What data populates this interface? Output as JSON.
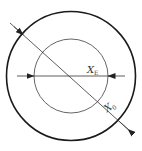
{
  "diagram": {
    "labels": {
      "inner_main": "X",
      "inner_sub": "E",
      "outer_main": "X",
      "outer_sub": "0"
    },
    "colors": {
      "outer_circle": "#1a1a1a",
      "inner_circle": "#555555",
      "lines": "#333333",
      "background": "#ffffff"
    }
  }
}
